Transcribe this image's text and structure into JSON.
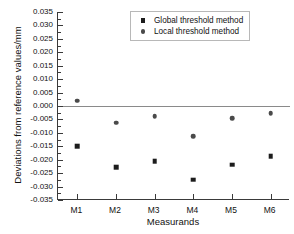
{
  "chart_data": {
    "type": "scatter",
    "title": "",
    "xlabel": "Measurands",
    "ylabel": "Deviations from reference values/mm",
    "categories": [
      "M1",
      "M2",
      "M3",
      "M4",
      "M5",
      "M6"
    ],
    "ylim": [
      -0.035,
      0.035
    ],
    "yticks": [
      0.035,
      0.03,
      0.025,
      0.02,
      0.015,
      0.01,
      0.005,
      0.0,
      -0.005,
      -0.01,
      -0.015,
      -0.02,
      -0.025,
      -0.03,
      -0.035
    ],
    "ytick_labels": [
      "0.035",
      "0.030",
      "0.025",
      "0.020",
      "0.015",
      "0.010",
      "0.005",
      "0.000",
      "-0.005",
      "-0.010",
      "-0.015",
      "-0.020",
      "-0.025",
      "-0.030",
      "-0.035"
    ],
    "grid": false,
    "legend_position": "top-right",
    "reference_line": 0.0,
    "series": [
      {
        "name": "Global threshold method",
        "marker": "square",
        "color": "#1c1c1c",
        "values": [
          -0.015,
          -0.0228,
          -0.0205,
          -0.0275,
          -0.0218,
          -0.0188
        ]
      },
      {
        "name": "Local threshold method",
        "marker": "circle",
        "color": "#4a4a4a",
        "values": [
          0.002,
          -0.0062,
          -0.0037,
          -0.0112,
          -0.0046,
          -0.0027
        ]
      }
    ]
  },
  "legend": {
    "items": [
      {
        "label": "Global threshold method",
        "marker": "square-marker-icon"
      },
      {
        "label": "Local threshold method",
        "marker": "circle-marker-icon"
      }
    ]
  },
  "axes": {
    "x_title": "Measurands",
    "y_title": "Deviations from reference values/mm"
  }
}
